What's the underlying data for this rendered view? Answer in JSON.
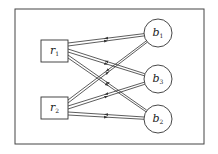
{
  "diagram": {
    "type": "bipartite-graph",
    "frame": {
      "x": 15,
      "y": 9,
      "w": 189,
      "h": 135,
      "stroke": "#444444"
    },
    "left_nodes": [
      {
        "id": "r1",
        "base": "r",
        "sub": "1",
        "shape": "square",
        "x": 41,
        "y": 40,
        "w": 27,
        "h": 22
      },
      {
        "id": "r2",
        "base": "r",
        "sub": "2",
        "shape": "square",
        "x": 41,
        "y": 97,
        "w": 27,
        "h": 22
      }
    ],
    "right_nodes": [
      {
        "id": "b1",
        "base": "b",
        "sub": "1",
        "shape": "circle",
        "cx": 158,
        "cy": 33,
        "r": 14
      },
      {
        "id": "b3",
        "base": "b",
        "sub": "3",
        "shape": "circle",
        "cx": 158,
        "cy": 79,
        "r": 14
      },
      {
        "id": "b2",
        "base": "b",
        "sub": "2",
        "shape": "circle",
        "cx": 158,
        "cy": 119,
        "r": 14
      }
    ],
    "edges": [
      {
        "from": "r1",
        "to": "b1",
        "bidirectional": true
      },
      {
        "from": "r1",
        "to": "b3",
        "bidirectional": true
      },
      {
        "from": "r1",
        "to": "b2",
        "bidirectional": true
      },
      {
        "from": "r2",
        "to": "b1",
        "bidirectional": true
      },
      {
        "from": "r2",
        "to": "b3",
        "bidirectional": true
      },
      {
        "from": "r2",
        "to": "b2",
        "bidirectional": true
      }
    ],
    "colors": {
      "line": "#333333",
      "background": "#ffffff",
      "text": "#222222"
    }
  }
}
